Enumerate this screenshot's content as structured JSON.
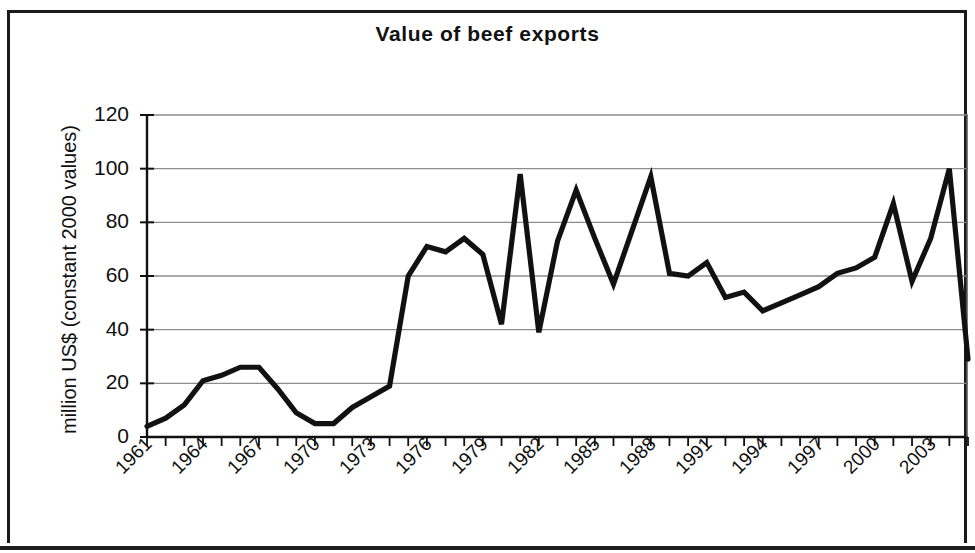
{
  "chart_title": "Value of beef exports",
  "axes": {
    "y_title": "million US$ (constant 2000 values)",
    "y_ticks": [
      "0",
      "20",
      "40",
      "60",
      "80",
      "100",
      "120"
    ],
    "x_ticks": [
      "1961",
      "1964",
      "1967",
      "1970",
      "1973",
      "1976",
      "1979",
      "1982",
      "1985",
      "1988",
      "1991",
      "1994",
      "1997",
      "2000",
      "2003"
    ]
  },
  "style": {
    "line_color": "#111111",
    "grid_color": "#8d8d8d",
    "axis_color": "#101010",
    "background": "#ffffff"
  },
  "chart_data": {
    "type": "line",
    "title": "Value of beef exports",
    "xlabel": "",
    "ylabel": "million US$ (constant 2000 values)",
    "ylim": [
      0,
      120
    ],
    "ytick_values": [
      0,
      20,
      40,
      60,
      80,
      100,
      120
    ],
    "xlim": [
      1961,
      2005
    ],
    "xtick_values": [
      1961,
      1964,
      1967,
      1970,
      1973,
      1976,
      1979,
      1982,
      1985,
      1988,
      1991,
      1994,
      1997,
      2000,
      2003
    ],
    "grid": "horizontal",
    "legend": "none",
    "x": [
      1961,
      1962,
      1963,
      1964,
      1965,
      1966,
      1967,
      1968,
      1969,
      1970,
      1971,
      1972,
      1973,
      1974,
      1975,
      1976,
      1977,
      1978,
      1979,
      1980,
      1981,
      1982,
      1983,
      1984,
      1985,
      1986,
      1987,
      1988,
      1989,
      1990,
      1991,
      1992,
      1993,
      1994,
      1995,
      1996,
      1997,
      1998,
      1999,
      2000,
      2001,
      2002,
      2003,
      2004,
      2005
    ],
    "values": [
      4,
      7,
      12,
      21,
      23,
      26,
      26,
      18,
      9,
      5,
      5,
      11,
      15,
      19,
      60,
      71,
      69,
      74,
      68,
      42,
      98,
      39,
      73,
      92,
      74,
      57,
      77,
      97,
      61,
      60,
      65,
      52,
      54,
      47,
      50,
      53,
      56,
      61,
      63,
      67,
      87,
      58,
      74,
      100,
      29
    ],
    "series": [
      {
        "name": "Value of beef exports",
        "values": [
          4,
          7,
          12,
          21,
          23,
          26,
          26,
          18,
          9,
          5,
          5,
          11,
          15,
          19,
          60,
          71,
          69,
          74,
          68,
          42,
          98,
          39,
          73,
          92,
          74,
          57,
          77,
          97,
          61,
          60,
          65,
          52,
          54,
          47,
          50,
          53,
          56,
          61,
          63,
          67,
          87,
          58,
          74,
          100,
          29
        ]
      }
    ]
  }
}
